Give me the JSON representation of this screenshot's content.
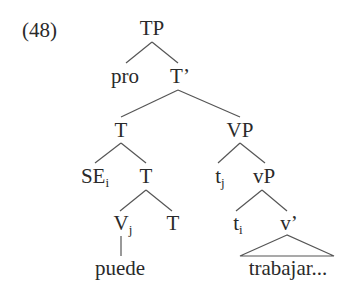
{
  "example_number": "(48)",
  "tree": {
    "root": {
      "label": "TP"
    },
    "pro": {
      "label": "pro"
    },
    "t_bar": {
      "label": "T’"
    },
    "t_head": {
      "label": "T"
    },
    "vp": {
      "label": "VP"
    },
    "se": {
      "label": "SE",
      "index": "i"
    },
    "t_inner": {
      "label": "T"
    },
    "v_j": {
      "label": "V",
      "index": "j"
    },
    "t_low": {
      "label": "T"
    },
    "trace_j": {
      "label": "t",
      "index": "j"
    },
    "little_vp": {
      "label": "vP"
    },
    "trace_i": {
      "label": "t",
      "index": "i"
    },
    "v_bar": {
      "label": "v’"
    },
    "puede": {
      "label": "puede"
    },
    "trabajar": {
      "label": "trabajar..."
    }
  }
}
